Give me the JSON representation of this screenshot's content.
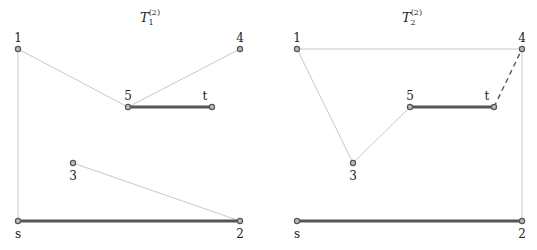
{
  "panels": [
    {
      "title": "T",
      "title_sub": "1",
      "title_sup": "(2)",
      "title_pos": [
        150,
        22
      ],
      "nodes": [
        {
          "id": "1",
          "x": 18,
          "y": 49,
          "lx": 18,
          "ly": 42
        },
        {
          "id": "4",
          "x": 240,
          "y": 49,
          "lx": 240,
          "ly": 42
        },
        {
          "id": "5",
          "x": 128,
          "y": 107,
          "lx": 128,
          "ly": 100
        },
        {
          "id": "t",
          "x": 212,
          "y": 107,
          "lx": 205,
          "ly": 100
        },
        {
          "id": "3",
          "x": 73,
          "y": 163,
          "lx": 73,
          "ly": 180
        },
        {
          "id": "s",
          "x": 18,
          "y": 221,
          "lx": 18,
          "ly": 238
        },
        {
          "id": "2",
          "x": 240,
          "y": 221,
          "lx": 240,
          "ly": 238
        }
      ],
      "edges": [
        {
          "from": "1",
          "to": "5",
          "style": "thin"
        },
        {
          "from": "4",
          "to": "5",
          "style": "thin"
        },
        {
          "from": "1",
          "to": "s",
          "style": "thin"
        },
        {
          "from": "3",
          "to": "2",
          "style": "thin"
        },
        {
          "from": "5",
          "to": "t",
          "style": "thick"
        },
        {
          "from": "s",
          "to": "2",
          "style": "thick"
        }
      ]
    },
    {
      "title": "T",
      "title_sub": "2",
      "title_sup": "(2)",
      "title_pos": [
        412,
        22
      ],
      "nodes": [
        {
          "id": "1",
          "x": 297,
          "y": 49,
          "lx": 297,
          "ly": 42
        },
        {
          "id": "4",
          "x": 522,
          "y": 49,
          "lx": 522,
          "ly": 42
        },
        {
          "id": "5",
          "x": 410,
          "y": 107,
          "lx": 410,
          "ly": 100
        },
        {
          "id": "t",
          "x": 494,
          "y": 107,
          "lx": 487,
          "ly": 100
        },
        {
          "id": "3",
          "x": 353,
          "y": 163,
          "lx": 353,
          "ly": 180
        },
        {
          "id": "s",
          "x": 297,
          "y": 221,
          "lx": 297,
          "ly": 238
        },
        {
          "id": "2",
          "x": 522,
          "y": 221,
          "lx": 522,
          "ly": 238
        }
      ],
      "edges": [
        {
          "from": "1",
          "to": "4",
          "style": "thin"
        },
        {
          "from": "1",
          "to": "3",
          "style": "thin"
        },
        {
          "from": "3",
          "to": "5",
          "style": "thin"
        },
        {
          "from": "4",
          "to": "2",
          "style": "thin"
        },
        {
          "from": "5",
          "to": "t",
          "style": "thick"
        },
        {
          "from": "t",
          "to": "4",
          "style": "dashed"
        },
        {
          "from": "s",
          "to": "2",
          "style": "thick"
        }
      ]
    }
  ],
  "colors": {
    "thin": "#c8c8c8",
    "thick": "#555555",
    "dashed": "#555555",
    "node_fill": "#bbbbbb",
    "node_stroke": "#555555"
  }
}
